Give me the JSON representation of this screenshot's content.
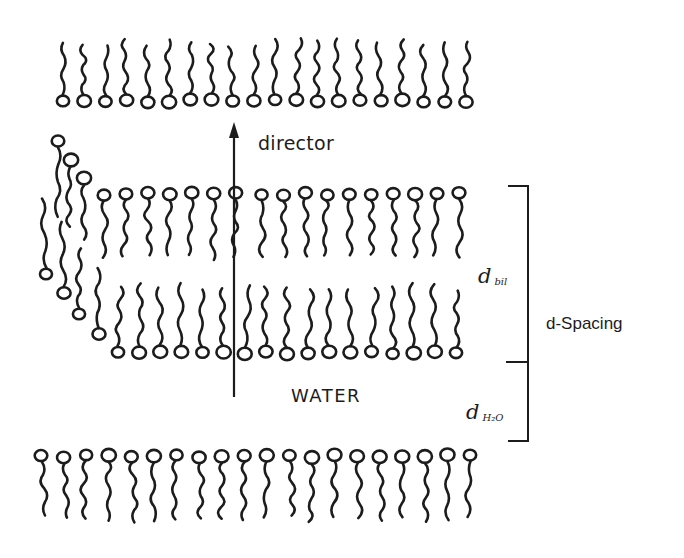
{
  "figure": {
    "colors": {
      "ink": "#1c1c1c",
      "background": "#ffffff"
    }
  },
  "labels": {
    "director": "director",
    "water": "WATER",
    "d_spacing": "d-Spacing",
    "d_bilayer_main": "d",
    "d_bilayer_sub": "bil",
    "d_water_main": "d",
    "d_water_sub": "H₂O"
  },
  "arrow": {
    "x": 234,
    "y_top": 122,
    "y_bottom": 397,
    "name": "director"
  },
  "bracket": {
    "x": 528,
    "tick_left": 508,
    "y_top": 186,
    "y_mid": 362,
    "y_bottom": 441
  },
  "layers": [
    {
      "name": "top-leaflet",
      "orientation": "tails-up",
      "head_y": 101,
      "tail_len": 52,
      "x_start": 63,
      "x_end": 466,
      "count": 20
    },
    {
      "name": "bilayer-upper-leaflet",
      "orientation": "tails-down",
      "head_y": 194,
      "tail_len": 58,
      "x_start": 104,
      "x_end": 455,
      "count": 17,
      "gap_after_index": 6
    },
    {
      "name": "bilayer-lower-leaflet",
      "orientation": "tails-up",
      "head_y": 353,
      "tail_len": 60,
      "x_start": 118,
      "x_end": 456,
      "count": 17
    },
    {
      "name": "bottom-leaflet",
      "orientation": "tails-down",
      "head_y": 456,
      "tail_len": 58,
      "x_start": 41,
      "x_end": 470,
      "count": 20
    }
  ],
  "curved_edge": [
    {
      "head_x": 58,
      "head_y": 141,
      "dir": "down",
      "tail_len": 70
    },
    {
      "head_x": 71,
      "head_y": 160,
      "dir": "down",
      "tail_len": 60
    },
    {
      "head_x": 84,
      "head_y": 178,
      "dir": "down",
      "tail_len": 55
    },
    {
      "head_x": 46,
      "head_y": 274,
      "dir": "up",
      "tail_len": 70
    },
    {
      "head_x": 64,
      "head_y": 293,
      "dir": "up",
      "tail_len": 65
    },
    {
      "head_x": 79,
      "head_y": 314,
      "dir": "up",
      "tail_len": 60
    },
    {
      "head_x": 99,
      "head_y": 334,
      "dir": "up",
      "tail_len": 60
    }
  ]
}
